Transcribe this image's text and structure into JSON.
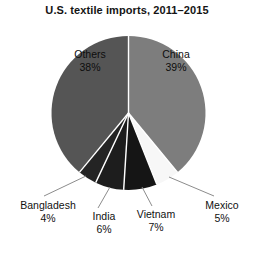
{
  "chart_data": {
    "type": "pie",
    "title": "U.S. textile imports, 2011–2015",
    "xlabel": "",
    "ylabel": "",
    "legend": "none",
    "grid": false,
    "units": "percent",
    "categories": [
      "China",
      "Mexico",
      "Vietnam",
      "India",
      "Bangladesh",
      "Others"
    ],
    "values": [
      39,
      5,
      7,
      6,
      4,
      38
    ],
    "slices": [
      {
        "name": "China",
        "value": 39,
        "label_name": "China",
        "label_pct": "39%",
        "color": "#7d7d7d",
        "label_position": "inside",
        "start_angle_deg": 0,
        "end_angle_deg": 140.4
      },
      {
        "name": "Mexico",
        "value": 5,
        "label_name": "Mexico",
        "label_pct": "5%",
        "color": "#f7f7f7",
        "label_position": "outside",
        "start_angle_deg": 140.4,
        "end_angle_deg": 158.4
      },
      {
        "name": "Vietnam",
        "value": 7,
        "label_name": "Vietnam",
        "label_pct": "7%",
        "color": "#151515",
        "label_position": "outside",
        "start_angle_deg": 158.4,
        "end_angle_deg": 183.6
      },
      {
        "name": "India",
        "value": 6,
        "label_name": "India",
        "label_pct": "6%",
        "color": "#1d1d1d",
        "label_position": "outside",
        "start_angle_deg": 183.6,
        "end_angle_deg": 205.2
      },
      {
        "name": "Bangladesh",
        "value": 4,
        "label_name": "Bangladesh",
        "label_pct": "4%",
        "color": "#242424",
        "label_position": "outside",
        "start_angle_deg": 205.2,
        "end_angle_deg": 219.6
      },
      {
        "name": "Others",
        "value": 38,
        "label_name": "Others",
        "label_pct": "38%",
        "color": "#555555",
        "label_position": "inside",
        "start_angle_deg": 219.6,
        "end_angle_deg": 360
      }
    ]
  },
  "colors": {
    "background": "#ffffff",
    "text": "#111111",
    "title": "#141414",
    "separator": "#ffffff",
    "leader_line": "#8c8c8c"
  }
}
